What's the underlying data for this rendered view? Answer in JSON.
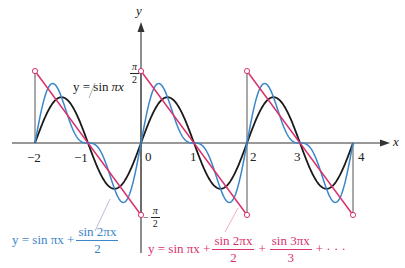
{
  "chart_data": {
    "type": "line",
    "title": "",
    "xlabel": "x",
    "ylabel": "y",
    "xlim": [
      -2.15,
      4.4
    ],
    "ylim": [
      -1.8,
      2.6
    ],
    "grid": false,
    "x_ticks": [
      "-2",
      "-1",
      "0",
      "1",
      "2",
      "3",
      "4"
    ],
    "y_ticks": [
      "π/2",
      "−π/2"
    ],
    "series": [
      {
        "name": "y = sin πx",
        "color": "#1a1a1a",
        "terms": 1,
        "x_range": [
          -2,
          4
        ]
      },
      {
        "name": "y = sin πx + sin 2πx / 2",
        "color": "#3a86c8",
        "terms": 2,
        "x_range": [
          -2,
          4
        ]
      },
      {
        "name": "y = sin πx + sin 2πx / 2 + sin 3πx / 3 + ···",
        "color": "#d8336f",
        "type": "sawtooth",
        "limit_value_at_jump_left": -1.5708,
        "limit_value_at_jump_right": 1.5708,
        "period": 2,
        "x_range": [
          -2,
          4
        ],
        "open_circles": [
          [
            -2,
            1.5708
          ],
          [
            0,
            1.5708
          ],
          [
            0,
            -1.5708
          ],
          [
            2,
            1.5708
          ],
          [
            2,
            -1.5708
          ],
          [
            4,
            -1.5708
          ]
        ]
      }
    ],
    "annotations": [
      {
        "text": "y = sin πx",
        "target_series": 0
      },
      {
        "text": "y = sin πx + (sin 2πx)/2",
        "target_series": 1
      },
      {
        "text": "y = sin πx + (sin 2πx)/2 + (sin 3πx)/3 + ···",
        "target_series": 2
      }
    ]
  },
  "labels": {
    "x_axis": "x",
    "y_axis": "y",
    "ticks": {
      "m2": "−2",
      "m1": "−1",
      "z": "0",
      "p1": "1",
      "p2": "2",
      "p3": "3",
      "p4": "4"
    },
    "pi": "π",
    "two": "2",
    "minus": "−"
  },
  "equations": {
    "black": {
      "lhs": "y = sin ",
      "rhs": "πx"
    },
    "blue": {
      "lhs": "y = sin πx + ",
      "num": "sin 2πx",
      "den": "2"
    },
    "pink": {
      "lhs": "y = sin πx + ",
      "num1": "sin 2πx",
      "den1": "2",
      "plus": "+",
      "num2": "sin 3πx",
      "den2": "3",
      "tail": "+ · · ·"
    }
  }
}
